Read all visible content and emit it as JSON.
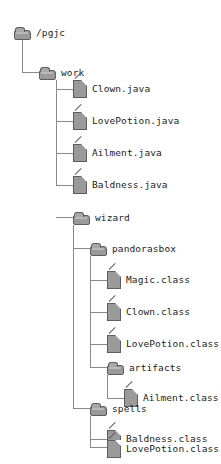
{
  "diagram": {
    "type": "file-tree",
    "colors": {
      "background": "#ffffff",
      "icon_fill": "#9a9a9a",
      "icon_border": "#5e5e5e",
      "connector": "#8a8a8a",
      "text": "#1c1c1c"
    },
    "nodes": [
      {
        "id": "n0",
        "label": "/pgjc",
        "kind": "folder",
        "depth": 0
      },
      {
        "id": "n1",
        "label": "work",
        "kind": "folder",
        "depth": 1
      },
      {
        "id": "n2",
        "label": "Clown.java",
        "kind": "file",
        "depth": 2
      },
      {
        "id": "n3",
        "label": "LovePotion.java",
        "kind": "file",
        "depth": 2
      },
      {
        "id": "n4",
        "label": "Ailment.java",
        "kind": "file",
        "depth": 2
      },
      {
        "id": "n5",
        "label": "Baldness.java",
        "kind": "file",
        "depth": 2
      },
      {
        "id": "n6",
        "label": "wizard",
        "kind": "folder",
        "depth": 2
      },
      {
        "id": "n7",
        "label": "pandorasbox",
        "kind": "folder",
        "depth": 3
      },
      {
        "id": "n8",
        "label": "Magic.class",
        "kind": "file",
        "depth": 4
      },
      {
        "id": "n9",
        "label": "Clown.class",
        "kind": "file",
        "depth": 4
      },
      {
        "id": "n10",
        "label": "LovePotion.class",
        "kind": "file",
        "depth": 4
      },
      {
        "id": "n11",
        "label": "artifacts",
        "kind": "folder",
        "depth": 4
      },
      {
        "id": "n12",
        "label": "Ailment.class",
        "kind": "file",
        "depth": 5
      },
      {
        "id": "n13",
        "label": "spells",
        "kind": "folder",
        "depth": 3
      },
      {
        "id": "n14",
        "label": "Baldness.class",
        "kind": "file",
        "depth": 4
      },
      {
        "id": "n15",
        "label": "LovePotion.class",
        "kind": "file",
        "depth": 4
      }
    ]
  }
}
